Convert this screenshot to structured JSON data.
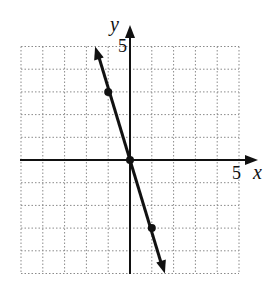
{
  "chart_data": {
    "type": "line",
    "title": "",
    "xlabel": "x",
    "ylabel": "y",
    "xlim": [
      -5,
      5
    ],
    "ylim": [
      -5,
      5
    ],
    "grid": true,
    "tick_labels": {
      "x": "5",
      "y": "5"
    },
    "series": [
      {
        "name": "y = -3x",
        "x": [
          -1,
          0,
          1
        ],
        "y": [
          3,
          0,
          -3
        ]
      }
    ],
    "marked_points": [
      [
        -1,
        3
      ],
      [
        0,
        0
      ],
      [
        1,
        -3
      ]
    ],
    "line_extent": {
      "x_start": -1.6,
      "y_start": 5,
      "x_end": 1.6,
      "y_end": -5
    },
    "colors": {
      "line": "#111111",
      "grid": "#888888",
      "axes": "#111111"
    }
  }
}
